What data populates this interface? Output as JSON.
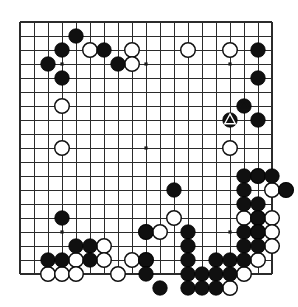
{
  "figure": {
    "kind": "go-board-diagram",
    "board_size": 19,
    "background_color": "#ffffff",
    "line_color": "#2b2b2b",
    "black_color": "#101010",
    "white_color": "#ffffff"
  },
  "board": {
    "columns": 19,
    "rows": 19,
    "origin_x": 20,
    "origin_y": 22,
    "spacing": 14,
    "star_points": [
      [
        4,
        4
      ],
      [
        10,
        4
      ],
      [
        16,
        4
      ],
      [
        4,
        10
      ],
      [
        10,
        10
      ],
      [
        16,
        10
      ],
      [
        4,
        16
      ],
      [
        10,
        16
      ],
      [
        16,
        16
      ]
    ]
  },
  "stones": {
    "black": [
      [
        5,
        2
      ],
      [
        4,
        3
      ],
      [
        7,
        3
      ],
      [
        18,
        3
      ],
      [
        3,
        4
      ],
      [
        8,
        4
      ],
      [
        4,
        5
      ],
      [
        18,
        5
      ],
      [
        17,
        7
      ],
      [
        16,
        8
      ],
      [
        18,
        8
      ],
      [
        17,
        12
      ],
      [
        18,
        12
      ],
      [
        19,
        12
      ],
      [
        17,
        13
      ],
      [
        20,
        13
      ],
      [
        12,
        13
      ],
      [
        17,
        14
      ],
      [
        18,
        14
      ],
      [
        4,
        15
      ],
      [
        18,
        15
      ],
      [
        10,
        16
      ],
      [
        13,
        16
      ],
      [
        17,
        16
      ],
      [
        18,
        16
      ],
      [
        13,
        17
      ],
      [
        17,
        17
      ],
      [
        18,
        17
      ],
      [
        5,
        17
      ],
      [
        6,
        17
      ],
      [
        3,
        18
      ],
      [
        4,
        18
      ],
      [
        6,
        18
      ],
      [
        10,
        18
      ],
      [
        13,
        18
      ],
      [
        15,
        18
      ],
      [
        16,
        18
      ],
      [
        17,
        18
      ],
      [
        10,
        19
      ],
      [
        13,
        19
      ],
      [
        14,
        19
      ],
      [
        15,
        19
      ],
      [
        16,
        19
      ],
      [
        11,
        20
      ],
      [
        13,
        20
      ],
      [
        14,
        20
      ],
      [
        15,
        20
      ]
    ],
    "white": [
      [
        6,
        3
      ],
      [
        9,
        3
      ],
      [
        13,
        3
      ],
      [
        16,
        3
      ],
      [
        9,
        4
      ],
      [
        4,
        7
      ],
      [
        4,
        10
      ],
      [
        16,
        10
      ],
      [
        18,
        12
      ],
      [
        19,
        13
      ],
      [
        20,
        13
      ],
      [
        12,
        15
      ],
      [
        17,
        15
      ],
      [
        18,
        15
      ],
      [
        19,
        15
      ],
      [
        10,
        16
      ],
      [
        11,
        16
      ],
      [
        18,
        16
      ],
      [
        19,
        16
      ],
      [
        7,
        17
      ],
      [
        19,
        17
      ],
      [
        5,
        18
      ],
      [
        7,
        18
      ],
      [
        9,
        18
      ],
      [
        10,
        18
      ],
      [
        18,
        18
      ],
      [
        3,
        19
      ],
      [
        4,
        19
      ],
      [
        5,
        19
      ],
      [
        8,
        19
      ],
      [
        17,
        19
      ],
      [
        16,
        20
      ]
    ]
  },
  "marked_stones": [
    {
      "color": "white",
      "mark": "triangle",
      "col": 17,
      "row": 7
    },
    {
      "color": "black",
      "mark": "triangle",
      "col": 16,
      "row": 8
    }
  ],
  "labels": {
    "board_name": "go-board",
    "mark_name": "triangle-marker"
  }
}
